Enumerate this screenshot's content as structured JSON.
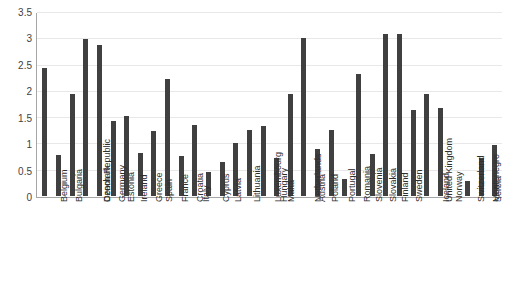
{
  "chart_data": {
    "type": "bar",
    "title": "",
    "xlabel": "",
    "ylabel": "",
    "ylim": [
      0,
      3.5
    ],
    "grid": true,
    "legend": false,
    "yticks": [
      "0",
      "0.5",
      "1",
      "1.5",
      "2",
      "2.5",
      "3",
      "3.5"
    ],
    "ytick_values": [
      0,
      0.5,
      1,
      1.5,
      2,
      2.5,
      3,
      3.5
    ],
    "bar_color": "#404040",
    "gridline_color": "#e8e8e8",
    "axis_color": "#a6a6a6",
    "categories": [
      "Belgium",
      "Bulgaria",
      "Czech Republic",
      "Denmark",
      "Germany",
      "Estonia",
      "Ireland",
      "Greece",
      "Spain",
      "France",
      "Croatia",
      "Italy",
      "Cyprus",
      "Latvia",
      "Lithuania",
      "Luxembourg",
      "Hungary",
      "Malta",
      "Netherlands",
      "Austria",
      "Poland",
      "Portugal",
      "Romania",
      "Slovenia",
      "Slovakia",
      "Finland",
      "Sweden",
      "United Kingdom",
      "Iceland",
      "Norway",
      "Switzerland",
      "Montenegro",
      "Serbia",
      "Turkey"
    ],
    "values": [
      2.45,
      0.78,
      1.95,
      3.0,
      2.89,
      1.43,
      1.53,
      0.83,
      1.25,
      2.24,
      0.76,
      1.35,
      0.45,
      0.66,
      1.02,
      1.27,
      1.33,
      0.72,
      1.96,
      3.03,
      0.9,
      1.26,
      0.33,
      2.33,
      0.8,
      3.1,
      3.09,
      1.65,
      1.96,
      1.68,
      0.0,
      0.28,
      0.72,
      0.98
    ]
  }
}
